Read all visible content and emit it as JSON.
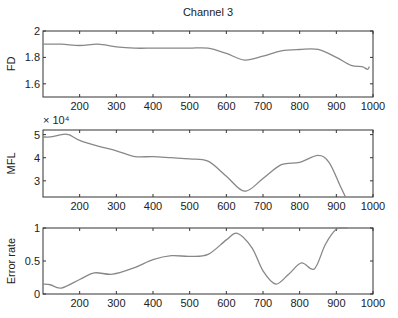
{
  "title": "Channel 3",
  "chart_data": [
    {
      "type": "line",
      "title": "Channel 3",
      "ylabel": "FD",
      "xlabel": "",
      "xlim": [
        100,
        1000
      ],
      "ylim": [
        1.5,
        2
      ],
      "xticks": [
        200,
        300,
        400,
        500,
        600,
        700,
        800,
        900,
        1000
      ],
      "yticks": [
        1.6,
        1.8,
        2
      ],
      "ytick_labels": [
        "1.6",
        "1.8",
        "2"
      ],
      "x": [
        100,
        150,
        200,
        250,
        300,
        350,
        400,
        450,
        500,
        550,
        600,
        650,
        700,
        750,
        800,
        850,
        900,
        940,
        970,
        985,
        990
      ],
      "values": [
        1.9,
        1.9,
        1.89,
        1.9,
        1.88,
        1.87,
        1.87,
        1.87,
        1.87,
        1.87,
        1.83,
        1.78,
        1.81,
        1.85,
        1.86,
        1.86,
        1.8,
        1.74,
        1.73,
        1.71,
        1.73
      ]
    },
    {
      "type": "line",
      "ylabel": "MFL",
      "xlabel": "",
      "y_multiplier": "× 10⁴",
      "xlim": [
        100,
        1000
      ],
      "ylim": [
        2.3,
        5.2
      ],
      "xticks": [
        200,
        300,
        400,
        500,
        600,
        700,
        800,
        900,
        1000
      ],
      "yticks": [
        3,
        4,
        5
      ],
      "ytick_labels": [
        "3",
        "4",
        "5"
      ],
      "x": [
        100,
        120,
        150,
        170,
        200,
        250,
        300,
        350,
        400,
        450,
        500,
        550,
        600,
        650,
        700,
        750,
        800,
        850,
        880,
        910,
        925
      ],
      "values": [
        4.9,
        4.9,
        5.0,
        5.0,
        4.75,
        4.5,
        4.3,
        4.05,
        4.05,
        4.0,
        3.95,
        3.85,
        3.2,
        2.55,
        3.1,
        3.7,
        3.8,
        4.1,
        3.8,
        2.8,
        2.3
      ]
    },
    {
      "type": "line",
      "ylabel": "Error rate",
      "xlabel": "",
      "xlim": [
        100,
        1000
      ],
      "ylim": [
        0,
        1
      ],
      "xticks": [
        200,
        300,
        400,
        500,
        600,
        700,
        800,
        900,
        1000
      ],
      "yticks": [
        0,
        0.5,
        1
      ],
      "ytick_labels": [
        "0",
        "0.5",
        "1"
      ],
      "x": [
        100,
        120,
        150,
        200,
        240,
        290,
        350,
        400,
        450,
        500,
        550,
        600,
        630,
        670,
        700,
        735,
        770,
        805,
        840,
        870,
        900,
        930
      ],
      "values": [
        0.15,
        0.14,
        0.09,
        0.22,
        0.32,
        0.3,
        0.4,
        0.52,
        0.58,
        0.57,
        0.6,
        0.82,
        0.92,
        0.7,
        0.35,
        0.15,
        0.3,
        0.47,
        0.38,
        0.75,
        0.98,
        1.0
      ]
    }
  ]
}
